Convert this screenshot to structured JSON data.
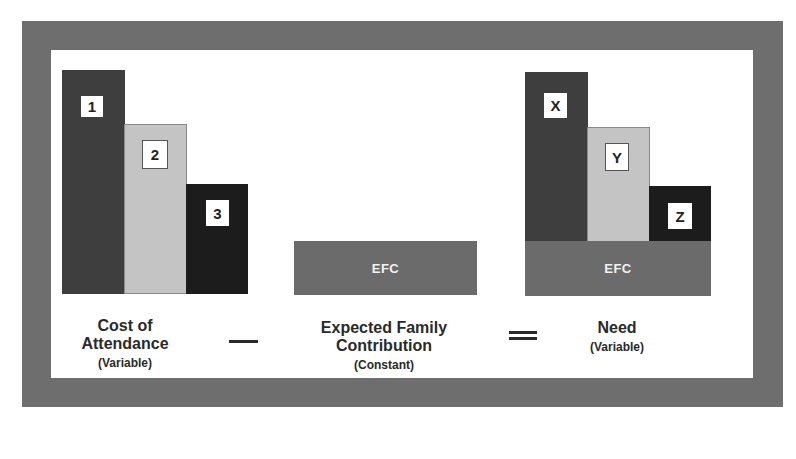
{
  "diagram": {
    "title": "",
    "colors": {
      "frame": "#6e6e6e",
      "bar_dark": "#3e3e3e",
      "bar_light": "#c4c4c4",
      "bar_black": "#1c1c1c",
      "efc": "#6b6b6b"
    },
    "cost_of_attendance": {
      "bars": [
        {
          "label": "1",
          "shade": "dark"
        },
        {
          "label": "2",
          "shade": "light"
        },
        {
          "label": "3",
          "shade": "black"
        }
      ],
      "caption": {
        "line1": "Cost of",
        "line2": "Attendance",
        "sub": "(Variable)"
      }
    },
    "operator_minus": "minus",
    "efc": {
      "block_label": "EFC",
      "caption": {
        "line1": "Expected Family",
        "line2": "Contribution",
        "sub": "(Constant)"
      }
    },
    "operator_equals": "equals",
    "need": {
      "bars": [
        {
          "label": "X",
          "shade": "dark"
        },
        {
          "label": "Y",
          "shade": "light"
        },
        {
          "label": "Z",
          "shade": "black"
        }
      ],
      "base_label": "EFC",
      "caption": {
        "line1": "Need",
        "sub": "(Variable)"
      }
    }
  }
}
